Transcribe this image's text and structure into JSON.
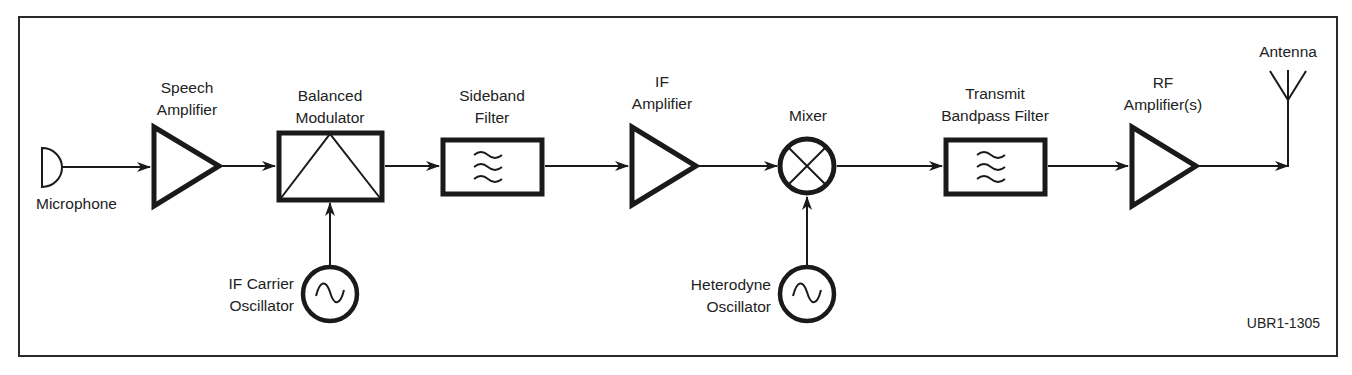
{
  "diagram": {
    "figure_id": "UBR1-1305",
    "colors": {
      "stroke": "#1a1a1a",
      "text": "#222222",
      "background": "#ffffff",
      "frame": "#2a2a2a"
    },
    "blocks": [
      {
        "id": "microphone",
        "icon": "microphone-icon",
        "label_lines": [
          "Microphone"
        ]
      },
      {
        "id": "speech-amplifier",
        "icon": "amplifier-triangle-icon",
        "label_lines": [
          "Speech",
          "Amplifier"
        ]
      },
      {
        "id": "balanced-modulator",
        "icon": "modulator-box-icon",
        "label_lines": [
          "Balanced",
          "Modulator"
        ]
      },
      {
        "id": "sideband-filter",
        "icon": "bandpass-filter-icon",
        "label_lines": [
          "Sideband",
          "Filter"
        ]
      },
      {
        "id": "if-amplifier",
        "icon": "amplifier-triangle-icon",
        "label_lines": [
          "IF",
          "Amplifier"
        ]
      },
      {
        "id": "mixer",
        "icon": "mixer-icon",
        "label_lines": [
          "Mixer"
        ]
      },
      {
        "id": "transmit-bandpass-filter",
        "icon": "bandpass-filter-icon",
        "label_lines": [
          "Transmit",
          "Bandpass Filter"
        ]
      },
      {
        "id": "rf-amplifier",
        "icon": "amplifier-triangle-icon",
        "label_lines": [
          "RF",
          "Amplifier(s)"
        ]
      },
      {
        "id": "antenna",
        "icon": "antenna-icon",
        "label_lines": [
          "Antenna"
        ]
      },
      {
        "id": "if-carrier-oscillator",
        "icon": "oscillator-icon",
        "label_lines": [
          "IF Carrier",
          "Oscillator"
        ]
      },
      {
        "id": "heterodyne-oscillator",
        "icon": "oscillator-icon",
        "label_lines": [
          "Heterodyne",
          "Oscillator"
        ]
      }
    ],
    "connections": [
      {
        "from": "microphone",
        "to": "speech-amplifier"
      },
      {
        "from": "speech-amplifier",
        "to": "balanced-modulator"
      },
      {
        "from": "balanced-modulator",
        "to": "sideband-filter"
      },
      {
        "from": "sideband-filter",
        "to": "if-amplifier"
      },
      {
        "from": "if-amplifier",
        "to": "mixer"
      },
      {
        "from": "mixer",
        "to": "transmit-bandpass-filter"
      },
      {
        "from": "transmit-bandpass-filter",
        "to": "rf-amplifier"
      },
      {
        "from": "rf-amplifier",
        "to": "antenna"
      },
      {
        "from": "if-carrier-oscillator",
        "to": "balanced-modulator"
      },
      {
        "from": "heterodyne-oscillator",
        "to": "mixer"
      }
    ]
  }
}
